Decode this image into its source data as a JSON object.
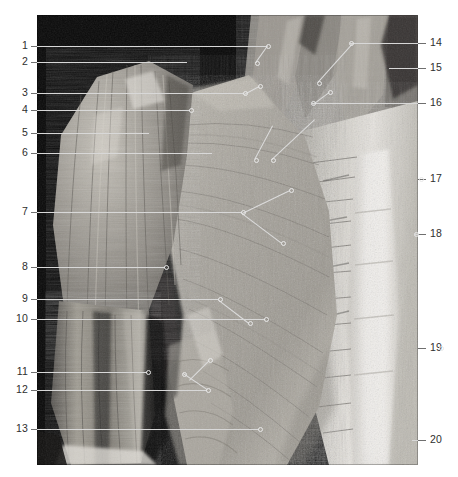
{
  "plate": {
    "type": "anatomical-photograph",
    "subject": "Human thorax, shoulder and neck — superficial muscles, anterior view",
    "background_color": "#ffffff",
    "photo_frame": {
      "x": 37,
      "y": 15,
      "width": 381,
      "height": 450
    },
    "label_color": "#2e2e2e",
    "leader_color_outside": "#6f6f6f",
    "leader_color_inside": "#d8d8d8"
  },
  "labels": {
    "left": [
      {
        "number": "1",
        "y": 46,
        "lead_to_x": 230,
        "lead_y_in": 46,
        "dot": true
      },
      {
        "number": "2",
        "y": 62,
        "lead_to_x": 150,
        "lead_y_in": 62,
        "dot": false
      },
      {
        "number": "3",
        "y": 93,
        "lead_to_x": 207,
        "lead_y_in": 93,
        "dot": true
      },
      {
        "number": "4",
        "y": 110,
        "lead_to_x": 153,
        "lead_y_in": 110,
        "dot": true
      },
      {
        "number": "5",
        "y": 133,
        "lead_to_x": 112,
        "lead_y_in": 133,
        "dot": false
      },
      {
        "number": "6",
        "y": 153,
        "lead_to_x": 175,
        "lead_y_in": 153,
        "dot": false
      },
      {
        "number": "7",
        "y": 212,
        "lead_to_x": 205,
        "lead_y_in": 212,
        "dot": true
      },
      {
        "number": "8",
        "y": 267,
        "lead_to_x": 128,
        "lead_y_in": 267,
        "dot": true
      },
      {
        "number": "9",
        "y": 299,
        "lead_to_x": 182,
        "lead_y_in": 299,
        "dot": true
      },
      {
        "number": "10",
        "y": 319,
        "lead_to_x": 228,
        "lead_y_in": 319,
        "dot": true
      },
      {
        "number": "11",
        "y": 372,
        "lead_to_x": 110,
        "lead_y_in": 372,
        "dot": true
      },
      {
        "number": "12",
        "y": 390,
        "lead_to_x": 170,
        "lead_y_in": 390,
        "dot": true
      },
      {
        "number": "13",
        "y": 429,
        "lead_to_x": 222,
        "lead_y_in": 429,
        "dot": true
      }
    ],
    "right": [
      {
        "number": "14",
        "y": 43,
        "lead_to_x": 313,
        "dot": true
      },
      {
        "number": "15",
        "y": 68,
        "lead_to_x": 352,
        "dot": false
      },
      {
        "number": "16",
        "y": 103,
        "lead_to_x": 275,
        "dot": true
      },
      {
        "number": "17",
        "y": 179,
        "lead_to_x": 383,
        "dot": true
      },
      {
        "number": "18",
        "y": 234,
        "lead_to_x": 378,
        "dot": true
      },
      {
        "number": "19",
        "y": 348,
        "lead_to_x": 403,
        "dot": true
      },
      {
        "number": "20",
        "y": 440,
        "lead_to_x": 375,
        "dot": false
      }
    ]
  },
  "diagonal_leaders": [
    {
      "id": "d1",
      "x1": 231,
      "y1": 46,
      "x2": 219,
      "y2": 63
    },
    {
      "id": "d2",
      "x1": 316,
      "y1": 44,
      "x2": 281,
      "y2": 83
    },
    {
      "id": "d3",
      "x1": 276,
      "y1": 104,
      "x2": 292,
      "y2": 92
    },
    {
      "id": "d4",
      "x1": 207,
      "y1": 94,
      "x2": 222,
      "y2": 86
    },
    {
      "id": "d5",
      "x1": 205,
      "y1": 213,
      "x2": 245,
      "y2": 243
    },
    {
      "id": "d6",
      "x1": 205,
      "y1": 213,
      "x2": 253,
      "y2": 190
    },
    {
      "id": "d7",
      "x1": 236,
      "y1": 126,
      "x2": 218,
      "y2": 160
    },
    {
      "id": "d8",
      "x1": 278,
      "y1": 120,
      "x2": 235,
      "y2": 160
    },
    {
      "id": "d9",
      "x1": 182,
      "y1": 300,
      "x2": 212,
      "y2": 323
    },
    {
      "id": "d10",
      "x1": 170,
      "y1": 390,
      "x2": 146,
      "y2": 374
    },
    {
      "id": "d11",
      "x1": 152,
      "y1": 380,
      "x2": 172,
      "y2": 360
    }
  ],
  "photo_content": {
    "regions": [
      {
        "name": "background-void",
        "tone": "#080808"
      },
      {
        "name": "deltoid-muscle",
        "tone": "#9a968f"
      },
      {
        "name": "pectoralis-major",
        "tone": "#a8a49d"
      },
      {
        "name": "neck-sternocleidomastoid",
        "tone": "#8d8a84"
      },
      {
        "name": "rectus-sheath-linea-alba",
        "tone": "#e6e4df"
      },
      {
        "name": "serratus-anterior",
        "tone": "#b0aca4"
      },
      {
        "name": "biceps-brachii",
        "tone": "#8e8a83"
      },
      {
        "name": "external-oblique",
        "tone": "#b6b2aa"
      }
    ]
  }
}
